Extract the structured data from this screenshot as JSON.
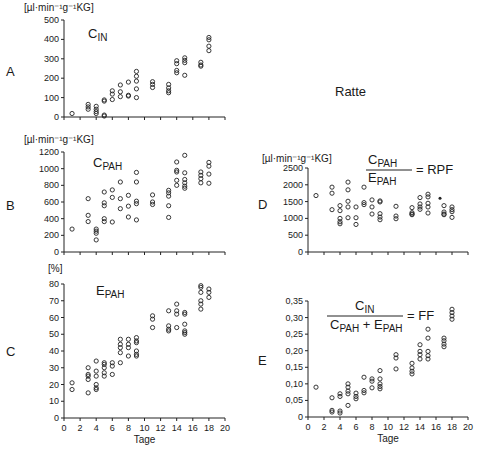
{
  "figure": {
    "title": "Ratte",
    "xlabel": "Tage",
    "x_ticks": [
      0,
      2,
      4,
      6,
      8,
      10,
      12,
      14,
      16,
      18,
      20
    ]
  },
  "chart_data": [
    {
      "id": "A",
      "type": "scatter",
      "letter": "A",
      "title": "C",
      "title_sub": "IN",
      "unit": "[µl·min⁻¹g⁻¹KG]",
      "ylabel": "µl·min⁻¹g⁻¹KG",
      "xlabel": "",
      "ylim": [
        0,
        500
      ],
      "xlim": [
        0,
        20
      ],
      "y_ticks": [
        0,
        100,
        200,
        300,
        400,
        500
      ],
      "y_tick_labels": [
        "0",
        "100",
        "200",
        "300",
        "400",
        "500"
      ],
      "points": [
        [
          1,
          18
        ],
        [
          3,
          65
        ],
        [
          3,
          52
        ],
        [
          3,
          40
        ],
        [
          4,
          55
        ],
        [
          4,
          40
        ],
        [
          4,
          28
        ],
        [
          4,
          18
        ],
        [
          5,
          10
        ],
        [
          5,
          5
        ],
        [
          5,
          88
        ],
        [
          5,
          82
        ],
        [
          6,
          135
        ],
        [
          6,
          118
        ],
        [
          6,
          90
        ],
        [
          7,
          165
        ],
        [
          7,
          130
        ],
        [
          7,
          105
        ],
        [
          8,
          180
        ],
        [
          8,
          112
        ],
        [
          8,
          108
        ],
        [
          9,
          235
        ],
        [
          9,
          210
        ],
        [
          9,
          185
        ],
        [
          9,
          145
        ],
        [
          9,
          100
        ],
        [
          11,
          182
        ],
        [
          11,
          168
        ],
        [
          11,
          152
        ],
        [
          13,
          168
        ],
        [
          13,
          150
        ],
        [
          13,
          135
        ],
        [
          13,
          125
        ],
        [
          14,
          290
        ],
        [
          14,
          275
        ],
        [
          14,
          240
        ],
        [
          14,
          228
        ],
        [
          15,
          305
        ],
        [
          15,
          292
        ],
        [
          15,
          280
        ],
        [
          15,
          215
        ],
        [
          17,
          282
        ],
        [
          17,
          268
        ],
        [
          17,
          262
        ],
        [
          18,
          410
        ],
        [
          18,
          398
        ],
        [
          18,
          365
        ],
        [
          18,
          342
        ]
      ]
    },
    {
      "id": "B",
      "type": "scatter",
      "letter": "B",
      "title": "C",
      "title_sub": "PAH",
      "unit": "[µl·min⁻¹g⁻¹KG]",
      "ylabel": "µl·min⁻¹g⁻¹KG",
      "xlabel": "",
      "ylim": [
        0,
        1200
      ],
      "xlim": [
        0,
        20
      ],
      "y_ticks": [
        0,
        200,
        400,
        600,
        800,
        1000,
        1200
      ],
      "y_tick_labels": [
        "0",
        "200",
        "400",
        "600",
        "800",
        "1000",
        "1200"
      ],
      "points": [
        [
          1,
          275
        ],
        [
          3,
          640
        ],
        [
          3,
          440
        ],
        [
          3,
          365
        ],
        [
          4,
          275
        ],
        [
          4,
          250
        ],
        [
          4,
          225
        ],
        [
          4,
          145
        ],
        [
          5,
          720
        ],
        [
          5,
          590
        ],
        [
          5,
          555
        ],
        [
          5,
          400
        ],
        [
          5,
          365
        ],
        [
          6,
          745
        ],
        [
          6,
          655
        ],
        [
          6,
          360
        ],
        [
          7,
          840
        ],
        [
          7,
          640
        ],
        [
          7,
          520
        ],
        [
          8,
          680
        ],
        [
          8,
          550
        ],
        [
          8,
          420
        ],
        [
          9,
          955
        ],
        [
          9,
          840
        ],
        [
          9,
          610
        ],
        [
          9,
          580
        ],
        [
          9,
          385
        ],
        [
          11,
          685
        ],
        [
          11,
          600
        ],
        [
          11,
          570
        ],
        [
          13,
          740
        ],
        [
          13,
          710
        ],
        [
          13,
          670
        ],
        [
          13,
          555
        ],
        [
          13,
          415
        ],
        [
          14,
          1080
        ],
        [
          14,
          980
        ],
        [
          14,
          960
        ],
        [
          14,
          860
        ],
        [
          14,
          800
        ],
        [
          15,
          1160
        ],
        [
          15,
          950
        ],
        [
          15,
          870
        ],
        [
          15,
          830
        ],
        [
          15,
          790
        ],
        [
          15,
          765
        ],
        [
          17,
          960
        ],
        [
          17,
          920
        ],
        [
          17,
          880
        ],
        [
          17,
          830
        ],
        [
          18,
          1075
        ],
        [
          18,
          1030
        ],
        [
          18,
          935
        ],
        [
          18,
          825
        ]
      ]
    },
    {
      "id": "C",
      "type": "scatter",
      "letter": "C",
      "title": "E",
      "title_sub": "PAH",
      "unit": "[%]",
      "ylabel": "%",
      "xlabel": "Tage",
      "ylim": [
        0,
        80
      ],
      "xlim": [
        0,
        20
      ],
      "y_ticks": [
        0,
        10,
        20,
        30,
        40,
        50,
        60,
        70,
        80
      ],
      "y_tick_labels": [
        "0",
        "10",
        "20",
        "30",
        "40",
        "50",
        "60",
        "70",
        "80"
      ],
      "points": [
        [
          1,
          21
        ],
        [
          1,
          17
        ],
        [
          3,
          30
        ],
        [
          3,
          26
        ],
        [
          3,
          25
        ],
        [
          3,
          23
        ],
        [
          3,
          15
        ],
        [
          4,
          34
        ],
        [
          4,
          28
        ],
        [
          4,
          25
        ],
        [
          4,
          20
        ],
        [
          4,
          18
        ],
        [
          4,
          17
        ],
        [
          5,
          33
        ],
        [
          5,
          32
        ],
        [
          5,
          30
        ],
        [
          5,
          27
        ],
        [
          5,
          25
        ],
        [
          6,
          33
        ],
        [
          6,
          31
        ],
        [
          6,
          26
        ],
        [
          7,
          47
        ],
        [
          7,
          44
        ],
        [
          7,
          42
        ],
        [
          7,
          39
        ],
        [
          7,
          33
        ],
        [
          8,
          47
        ],
        [
          8,
          44
        ],
        [
          8,
          42
        ],
        [
          8,
          37
        ],
        [
          9,
          48
        ],
        [
          9,
          46
        ],
        [
          9,
          45
        ],
        [
          9,
          40
        ],
        [
          9,
          38
        ],
        [
          9,
          37
        ],
        [
          11,
          61
        ],
        [
          11,
          59
        ],
        [
          11,
          54
        ],
        [
          13,
          64
        ],
        [
          13,
          55
        ],
        [
          13,
          53
        ],
        [
          13,
          52
        ],
        [
          14,
          68
        ],
        [
          14,
          64
        ],
        [
          14,
          62
        ],
        [
          14,
          54
        ],
        [
          15,
          63
        ],
        [
          15,
          62
        ],
        [
          15,
          56
        ],
        [
          15,
          52
        ],
        [
          15,
          51
        ],
        [
          15,
          50
        ],
        [
          17,
          79
        ],
        [
          17,
          78
        ],
        [
          17,
          75
        ],
        [
          17,
          70
        ],
        [
          17,
          68
        ],
        [
          17,
          65
        ],
        [
          18,
          77
        ],
        [
          18,
          75
        ],
        [
          18,
          72
        ]
      ]
    },
    {
      "id": "D",
      "type": "scatter",
      "letter": "D",
      "title": "C",
      "title_sub": "PAH",
      "title_den": "E",
      "title_den_sub": "PAH",
      "title_eq": "= RPF",
      "unit": "[µl·min⁻¹g⁻¹KG]",
      "ylabel": "µl·min⁻¹g⁻¹KG",
      "xlabel": "",
      "ylim": [
        0,
        2500
      ],
      "xlim": [
        0,
        20
      ],
      "y_ticks": [
        0,
        500,
        1000,
        1500,
        2000,
        2500
      ],
      "y_tick_labels": [
        "0",
        "500",
        "1000",
        "1500",
        "2000",
        "2500"
      ],
      "points": [
        [
          1,
          1680
        ],
        [
          3,
          1930
        ],
        [
          3,
          1750
        ],
        [
          3,
          1260
        ],
        [
          4,
          1380
        ],
        [
          4,
          1230
        ],
        [
          4,
          1000
        ],
        [
          4,
          900
        ],
        [
          4,
          840
        ],
        [
          5,
          2080
        ],
        [
          5,
          1850
        ],
        [
          5,
          1510
        ],
        [
          5,
          1340
        ],
        [
          5,
          1020
        ],
        [
          6,
          1340
        ],
        [
          6,
          1020
        ],
        [
          6,
          820
        ],
        [
          7,
          1930
        ],
        [
          7,
          1470
        ],
        [
          7,
          1410
        ],
        [
          8,
          1550
        ],
        [
          8,
          1340
        ],
        [
          8,
          1130
        ],
        [
          9,
          1520
        ],
        [
          9,
          1490
        ],
        [
          9,
          1140
        ],
        [
          9,
          1040
        ],
        [
          9,
          960
        ],
        [
          11,
          1360
        ],
        [
          11,
          1070
        ],
        [
          11,
          990
        ],
        [
          13,
          1320
        ],
        [
          13,
          1170
        ],
        [
          13,
          1130
        ],
        [
          13,
          1110
        ],
        [
          14,
          1620
        ],
        [
          14,
          1430
        ],
        [
          14,
          1340
        ],
        [
          14,
          1270
        ],
        [
          15,
          1720
        ],
        [
          15,
          1640
        ],
        [
          15,
          1450
        ],
        [
          15,
          1340
        ],
        [
          15,
          1160
        ],
        [
          17,
          1380
        ],
        [
          17,
          1190
        ],
        [
          17,
          1130
        ],
        [
          17,
          1110
        ],
        [
          18,
          1340
        ],
        [
          18,
          1260
        ],
        [
          18,
          1200
        ],
        [
          18,
          1030
        ]
      ],
      "marked_points": [
        [
          16.5,
          1600
        ]
      ]
    },
    {
      "id": "E",
      "type": "scatter",
      "letter": "E",
      "title": "C",
      "title_sub": "IN",
      "title_den": "C",
      "title_den_sub": "PAH",
      "title_den2": "E",
      "title_den2_sub": "PAH",
      "title_eq": "= FF",
      "unit": "",
      "ylabel": "",
      "xlabel": "Tage",
      "ylim": [
        0,
        0.35
      ],
      "xlim": [
        0,
        20
      ],
      "y_ticks": [
        0,
        0.05,
        0.1,
        0.15,
        0.2,
        0.25,
        0.3,
        0.35
      ],
      "y_tick_labels": [
        "0",
        "0,05",
        "0,10",
        "0,15",
        "0,20",
        "0,25",
        "0,30",
        "0,35"
      ],
      "points": [
        [
          1,
          0.09
        ],
        [
          3,
          0.058
        ],
        [
          3,
          0.02
        ],
        [
          3,
          0.015
        ],
        [
          4,
          0.07
        ],
        [
          4,
          0.062
        ],
        [
          4,
          0.018
        ],
        [
          4,
          0.012
        ],
        [
          5,
          0.1
        ],
        [
          5,
          0.09
        ],
        [
          5,
          0.078
        ],
        [
          5,
          0.07
        ],
        [
          5,
          0.035
        ],
        [
          6,
          0.072
        ],
        [
          6,
          0.062
        ],
        [
          6,
          0.055
        ],
        [
          7,
          0.12
        ],
        [
          7,
          0.08
        ],
        [
          7,
          0.073
        ],
        [
          8,
          0.115
        ],
        [
          8,
          0.108
        ],
        [
          8,
          0.088
        ],
        [
          9,
          0.14
        ],
        [
          9,
          0.115
        ],
        [
          9,
          0.1
        ],
        [
          9,
          0.092
        ],
        [
          9,
          0.085
        ],
        [
          11,
          0.188
        ],
        [
          11,
          0.178
        ],
        [
          11,
          0.145
        ],
        [
          13,
          0.162
        ],
        [
          13,
          0.148
        ],
        [
          13,
          0.138
        ],
        [
          13,
          0.13
        ],
        [
          14,
          0.218
        ],
        [
          14,
          0.198
        ],
        [
          14,
          0.188
        ],
        [
          14,
          0.175
        ],
        [
          15,
          0.265
        ],
        [
          15,
          0.238
        ],
        [
          15,
          0.198
        ],
        [
          15,
          0.185
        ],
        [
          15,
          0.175
        ],
        [
          17,
          0.238
        ],
        [
          17,
          0.23
        ],
        [
          17,
          0.22
        ],
        [
          17,
          0.212
        ],
        [
          18,
          0.325
        ],
        [
          18,
          0.315
        ],
        [
          18,
          0.305
        ],
        [
          18,
          0.295
        ]
      ]
    }
  ]
}
